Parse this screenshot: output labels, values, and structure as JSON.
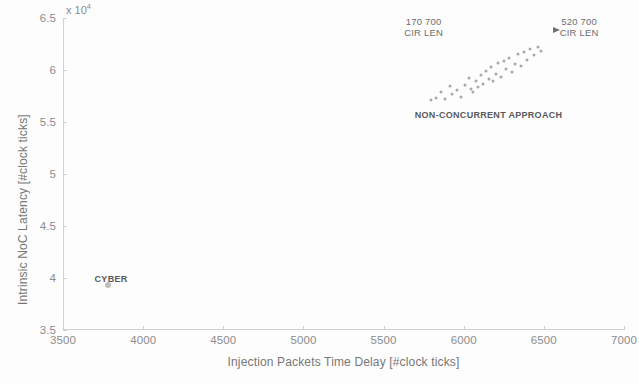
{
  "chart_data": {
    "type": "scatter",
    "title": "",
    "xlabel": "Injection Packets Time Delay [#clock ticks]",
    "ylabel": "Intrinsic NoC Latency [#clock ticks]",
    "xlim": [
      3500,
      7000
    ],
    "ylim": [
      35000,
      65000
    ],
    "y_multiplier": "x 10",
    "y_exponent": "4",
    "grid": false,
    "legend": "none",
    "xticks": [
      3500,
      4000,
      4500,
      5000,
      5500,
      6000,
      6500,
      7000
    ],
    "xtick_labels": [
      "3500",
      "4000",
      "4500",
      "5000",
      "5500",
      "6000",
      "6500",
      "7000"
    ],
    "yticks": [
      35000,
      40000,
      45000,
      50000,
      55000,
      60000,
      65000
    ],
    "ytick_labels": [
      "3.5",
      "4",
      "4.5",
      "5",
      "5.5",
      "6",
      "6.5"
    ],
    "series": [
      {
        "name": "CYBER",
        "points": [
          [
            3780,
            39300
          ]
        ]
      },
      {
        "name": "NON-CONCURRENT APPROACH",
        "points": [
          [
            5795,
            57150
          ],
          [
            5830,
            57350
          ],
          [
            5860,
            57900
          ],
          [
            5885,
            57200
          ],
          [
            5915,
            58450
          ],
          [
            5930,
            57650
          ],
          [
            5960,
            58100
          ],
          [
            5985,
            57450
          ],
          [
            6010,
            58600
          ],
          [
            6030,
            59250
          ],
          [
            6045,
            58200
          ],
          [
            6060,
            57900
          ],
          [
            6075,
            58950
          ],
          [
            6090,
            58350
          ],
          [
            6105,
            59500
          ],
          [
            6120,
            58700
          ],
          [
            6140,
            59900
          ],
          [
            6155,
            59150
          ],
          [
            6170,
            60250
          ],
          [
            6185,
            58900
          ],
          [
            6200,
            59600
          ],
          [
            6215,
            60650
          ],
          [
            6230,
            59350
          ],
          [
            6250,
            60900
          ],
          [
            6265,
            60100
          ],
          [
            6285,
            61200
          ],
          [
            6300,
            59800
          ],
          [
            6320,
            60550
          ],
          [
            6340,
            61500
          ],
          [
            6355,
            60350
          ],
          [
            6375,
            61750
          ],
          [
            6395,
            61000
          ],
          [
            6415,
            62000
          ],
          [
            6440,
            61450
          ],
          [
            6465,
            62200
          ],
          [
            6485,
            61850
          ]
        ]
      }
    ],
    "annotations": [
      {
        "id": "annotation-cir-len-170",
        "line1": "170 700",
        "line2": "CIR LEN",
        "x": 5750,
        "y": 65200
      },
      {
        "id": "annotation-cir-len-520",
        "line1": "520 700",
        "line2": "CIR LEN",
        "x": 6720,
        "y": 65200
      },
      {
        "id": "annotation-non-concurrent",
        "text": "NON-CONCURRENT APPROACH",
        "x": 6155,
        "y": 56200
      },
      {
        "id": "annotation-cyber",
        "text": "CYBER",
        "x": 3800,
        "y": 40400
      }
    ],
    "colors": {
      "point": "#9a9a9a",
      "axis": "#d2d2d2",
      "tick_text": "#8c8c8c",
      "axis_title": "#777777",
      "annotation": "#6e6e6e",
      "background": "#fdfdfd"
    }
  }
}
